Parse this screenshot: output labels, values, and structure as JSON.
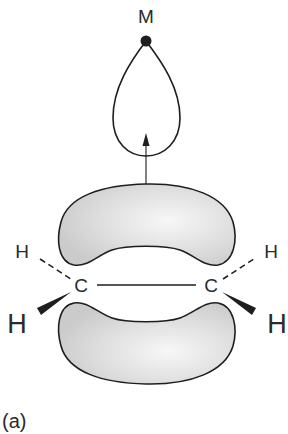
{
  "figure": {
    "panel_label": "(a)",
    "metal_label": "M",
    "carbon_left": "C",
    "carbon_right": "C",
    "h_back_left": "H",
    "h_back_right": "H",
    "h_front_left": "H",
    "h_front_right": "H",
    "colors": {
      "outline": "#1e1e1e",
      "lobe_fill_light": "#f4f4f4",
      "lobe_fill_dark": "#cfcfcf",
      "text": "#2a2a2a"
    }
  }
}
